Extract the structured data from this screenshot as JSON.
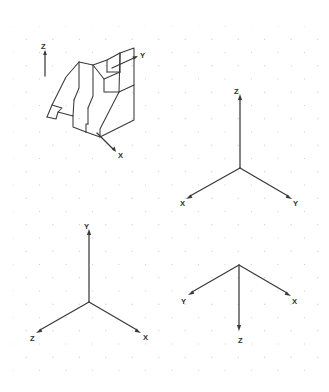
{
  "page": {
    "kind": "engineering-drawing-worksheet",
    "background_color": "#ffffff",
    "grid": {
      "type": "dotted",
      "dot_color": "#b9b9c4",
      "spacing_px": 13.25,
      "visible": true
    },
    "line_color": "#3a3a3a"
  },
  "panels": [
    {
      "id": "object-panel",
      "name": "isometric-v-block",
      "position": "top-left",
      "description": "Isometric pictorial of a V-block bracket with notched base",
      "axes": [
        {
          "label": "Z",
          "direction": "up",
          "arrow": true
        },
        {
          "label": "Y",
          "direction": "up-right",
          "arrow": true
        },
        {
          "label": "X",
          "direction": "down-right",
          "arrow": true
        }
      ]
    },
    {
      "id": "triad-top-right",
      "name": "axis-triad-1",
      "position": "top-right",
      "axes": [
        {
          "label": "Z",
          "direction": "up",
          "arrow": true
        },
        {
          "label": "X",
          "direction": "down-left",
          "arrow": true
        },
        {
          "label": "Y",
          "direction": "down-right",
          "arrow": true
        }
      ]
    },
    {
      "id": "triad-bottom-left",
      "name": "axis-triad-2",
      "position": "bottom-left",
      "axes": [
        {
          "label": "Y",
          "direction": "up",
          "arrow": true
        },
        {
          "label": "Z",
          "direction": "down-left",
          "arrow": true
        },
        {
          "label": "X",
          "direction": "down-right",
          "arrow": true
        }
      ]
    },
    {
      "id": "triad-bottom-right",
      "name": "axis-triad-3",
      "position": "bottom-right",
      "axes": [
        {
          "label": "Z",
          "direction": "down",
          "arrow": true
        },
        {
          "label": "Y",
          "direction": "up-left",
          "arrow": true
        },
        {
          "label": "X",
          "direction": "up-right",
          "arrow": true
        }
      ]
    }
  ],
  "labels": {
    "obj_z": "Z",
    "obj_y": "Y",
    "obj_x": "X",
    "t1_z": "Z",
    "t1_x": "X",
    "t1_y": "Y",
    "t2_y": "Y",
    "t2_z": "Z",
    "t2_x": "X",
    "t3_z": "Z",
    "t3_y": "Y",
    "t3_x": "X"
  }
}
